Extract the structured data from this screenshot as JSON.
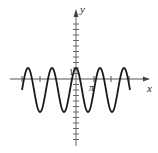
{
  "figure": {
    "axis_labels": {
      "x": "x",
      "y": "y"
    },
    "tick_labels": {
      "one": "1",
      "pi": "π"
    },
    "colors": {
      "curve": "#1a1a1a",
      "axes": "#555555",
      "background": "#ffffff"
    }
  },
  "chart_data": {
    "type": "line",
    "title": "",
    "xlabel": "x",
    "ylabel": "y",
    "function_estimate": "y = 2cos(3x/2) - 1",
    "annotations": [
      "1",
      "π"
    ],
    "x_range_units": [
      -3.5,
      2.8
    ],
    "y_range_units": [
      -3,
      1
    ],
    "maxima_y": 1,
    "minima_y": -3,
    "grid": false,
    "legend": null,
    "pixel_geometry": {
      "origin": [
        76,
        79
      ],
      "px_per_unit_y": 11,
      "px_per_pi_x": 18,
      "peak_x_px": [
        29,
        52,
        76,
        98,
        121
      ],
      "trough_x_px": [
        40,
        64,
        87,
        110
      ],
      "curve_start_px": [
        22,
        103
      ],
      "curve_end_px": [
        130,
        103
      ],
      "x_ticks_px": [
        22,
        40,
        111,
        129
      ]
    }
  }
}
